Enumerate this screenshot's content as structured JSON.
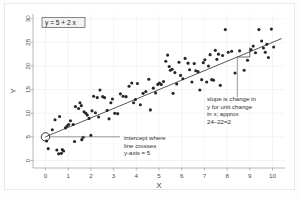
{
  "figure": {
    "background_color": "#ffffff",
    "border_color": "#e9e9e9",
    "equation_label": "y = 5 + 2 x"
  },
  "annotations": {
    "intercept": {
      "line1": "intercept where",
      "line2": "line crosses",
      "line3": "y-axis = 5"
    },
    "slope": {
      "line1": "slope is change in",
      "line2": "y for unit change",
      "line3": "in x; approx",
      "line4": "24–22=2"
    }
  },
  "chart_data": {
    "type": "scatter",
    "title": "",
    "xlabel": "X",
    "ylabel": "Y",
    "xlim": [
      -0.55,
      10.55
    ],
    "ylim": [
      -1.6,
      31.0
    ],
    "xticks": [
      0,
      1,
      2,
      3,
      4,
      5,
      6,
      7,
      8,
      9,
      10
    ],
    "xticklabels": [
      "0",
      "1",
      "2",
      "3",
      "4",
      "5",
      "6",
      "7",
      "8",
      "9",
      "10"
    ],
    "yticks": [
      0,
      5,
      10,
      15,
      20,
      25,
      30
    ],
    "yticklabels": [
      "0",
      "5",
      "10",
      "15",
      "20",
      "25",
      "30"
    ],
    "grid": true,
    "legend": false,
    "point_color": "#272727",
    "line_color": "#1f1f1f",
    "regression": {
      "intercept": 5,
      "slope": 2,
      "equation": "y = 5 + 2 x",
      "x_start": 0,
      "x_end": 10.4
    },
    "intercept_marker": {
      "x": 0,
      "y": 5
    },
    "slope_bracket": {
      "x_left": 8.45,
      "x_right": 9.0,
      "y_low": 21.9,
      "y_high": 23.9
    },
    "series": [
      {
        "name": "observations",
        "points": [
          [
            0.05,
            4.1
          ],
          [
            0.12,
            2.5
          ],
          [
            0.3,
            6.5
          ],
          [
            0.42,
            8.6
          ],
          [
            0.5,
            2.2
          ],
          [
            0.58,
            1.4
          ],
          [
            0.62,
            9.3
          ],
          [
            0.7,
            1.5
          ],
          [
            0.74,
            2.3
          ],
          [
            0.8,
            2.0
          ],
          [
            0.88,
            6.9
          ],
          [
            0.95,
            7.3
          ],
          [
            1.02,
            7.6
          ],
          [
            1.1,
            8.4
          ],
          [
            1.22,
            7.6
          ],
          [
            1.28,
            4.0
          ],
          [
            1.32,
            11.4
          ],
          [
            1.46,
            11.0
          ],
          [
            1.52,
            12.2
          ],
          [
            1.58,
            11.6
          ],
          [
            1.6,
            4.4
          ],
          [
            1.66,
            4.9
          ],
          [
            1.7,
            10.3
          ],
          [
            1.78,
            10.0
          ],
          [
            1.84,
            9.6
          ],
          [
            1.92,
            8.9
          ],
          [
            2.0,
            5.3
          ],
          [
            2.05,
            10.5
          ],
          [
            2.12,
            13.6
          ],
          [
            2.2,
            10.1
          ],
          [
            2.28,
            13.3
          ],
          [
            2.34,
            9.2
          ],
          [
            2.4,
            14.9
          ],
          [
            2.52,
            13.5
          ],
          [
            2.6,
            13.3
          ],
          [
            2.72,
            10.6
          ],
          [
            2.8,
            8.8
          ],
          [
            2.88,
            12.2
          ],
          [
            2.95,
            13.0
          ],
          [
            3.05,
            10.0
          ],
          [
            3.18,
            9.9
          ],
          [
            3.3,
            14.1
          ],
          [
            3.42,
            13.6
          ],
          [
            3.55,
            13.5
          ],
          [
            3.68,
            15.7
          ],
          [
            3.8,
            16.4
          ],
          [
            3.88,
            12.2
          ],
          [
            3.96,
            12.9
          ],
          [
            4.05,
            16.3
          ],
          [
            4.18,
            11.8
          ],
          [
            4.3,
            14.2
          ],
          [
            4.42,
            14.6
          ],
          [
            4.55,
            17.2
          ],
          [
            4.62,
            10.7
          ],
          [
            4.75,
            15.3
          ],
          [
            4.85,
            14.3
          ],
          [
            4.95,
            16.1
          ],
          [
            5.02,
            16.4
          ],
          [
            5.1,
            16.1
          ],
          [
            5.2,
            16.7
          ],
          [
            5.3,
            21.0
          ],
          [
            5.38,
            22.3
          ],
          [
            5.45,
            19.9
          ],
          [
            5.5,
            19.1
          ],
          [
            5.58,
            19.3
          ],
          [
            5.62,
            14.2
          ],
          [
            5.7,
            18.6
          ],
          [
            5.78,
            16.2
          ],
          [
            5.88,
            20.8
          ],
          [
            5.95,
            18.0
          ],
          [
            6.05,
            17.3
          ],
          [
            6.15,
            21.6
          ],
          [
            6.28,
            20.6
          ],
          [
            6.35,
            19.2
          ],
          [
            6.45,
            16.6
          ],
          [
            6.55,
            20.5
          ],
          [
            6.62,
            19.0
          ],
          [
            6.72,
            18.8
          ],
          [
            6.8,
            14.9
          ],
          [
            6.88,
            17.1
          ],
          [
            6.95,
            20.7
          ],
          [
            7.02,
            21.3
          ],
          [
            7.1,
            16.6
          ],
          [
            7.18,
            20.0
          ],
          [
            7.25,
            22.4
          ],
          [
            7.32,
            17.1
          ],
          [
            7.4,
            17.0
          ],
          [
            7.48,
            23.3
          ],
          [
            7.55,
            21.4
          ],
          [
            7.62,
            22.5
          ],
          [
            7.7,
            15.9
          ],
          [
            7.8,
            22.2
          ],
          [
            7.92,
            27.7
          ],
          [
            8.05,
            22.9
          ],
          [
            8.2,
            23.1
          ],
          [
            8.35,
            18.5
          ],
          [
            8.55,
            23.2
          ],
          [
            8.75,
            19.1
          ],
          [
            8.9,
            21.2
          ],
          [
            9.05,
            23.5
          ],
          [
            9.15,
            24.2
          ],
          [
            9.25,
            22.8
          ],
          [
            9.4,
            27.7
          ],
          [
            9.52,
            25.3
          ],
          [
            9.6,
            23.8
          ],
          [
            9.68,
            22.9
          ],
          [
            9.75,
            24.6
          ],
          [
            9.82,
            21.8
          ],
          [
            9.95,
            27.8
          ],
          [
            10.05,
            24.0
          ]
        ]
      }
    ]
  }
}
